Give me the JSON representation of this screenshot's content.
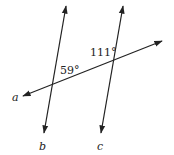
{
  "diagram": {
    "type": "parallel-lines-transversal",
    "lines": [
      {
        "name": "a",
        "label": "a",
        "role": "transversal"
      },
      {
        "name": "b",
        "label": "b",
        "role": "line"
      },
      {
        "name": "c",
        "label": "c",
        "role": "line"
      }
    ],
    "angles": [
      {
        "label": "59°",
        "at": "intersection of a and b",
        "position": "above-right"
      },
      {
        "label": "111°",
        "at": "intersection of a and c",
        "position": "above-left"
      }
    ],
    "colors": {
      "stroke": "#222222",
      "background": "#ffffff"
    }
  }
}
